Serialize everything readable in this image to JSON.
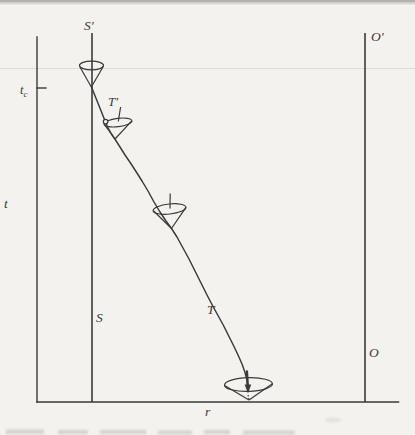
{
  "figure": {
    "kind": "spacetime-light-cone-diagram"
  },
  "labels": {
    "s_prime": "S′",
    "o_prime": "O′",
    "t_c_base": "t",
    "t_c_sub": "c",
    "t_axis": "t",
    "t_prime": "T′",
    "s": "S",
    "t_curve": "T",
    "o": "O",
    "r_axis": "r"
  },
  "colors": {
    "paper": "#f3f2ee",
    "ink": "#3a3a3a",
    "crease_line": "#dcdbd6",
    "top_edge_band": "#b3b2ad",
    "caption_remnant": "#8f8f89"
  },
  "diagram": {
    "vertical_axis_label": "t",
    "horizontal_axis_label": "r",
    "time_tick_label": "tc",
    "worldlines": [
      {
        "name": "surface",
        "top_label": "S′",
        "bottom_label": "S",
        "orientation": "vertical"
      },
      {
        "name": "observer",
        "top_label": "O′",
        "bottom_label": "O",
        "orientation": "vertical"
      },
      {
        "name": "trajectory",
        "upper_label": "T′",
        "lower_label": "T",
        "style": "curve from S′ at t_c down-right, ending with downward arrow at the r-axis"
      }
    ],
    "light_cones": [
      {
        "index": 1,
        "position": "on S′ worldline at t_c",
        "shape": "narrow, upright"
      },
      {
        "index": 2,
        "position": "upper trajectory, beside label T′",
        "shape": "slightly tilted, small circle where trajectory crosses cone rim"
      },
      {
        "index": 3,
        "position": "middle of trajectory",
        "shape": "wider, slightly tilted"
      },
      {
        "index": 4,
        "position": "end of trajectory on r-axis",
        "shape": "widest and flattened, dotted axis inside"
      }
    ]
  }
}
